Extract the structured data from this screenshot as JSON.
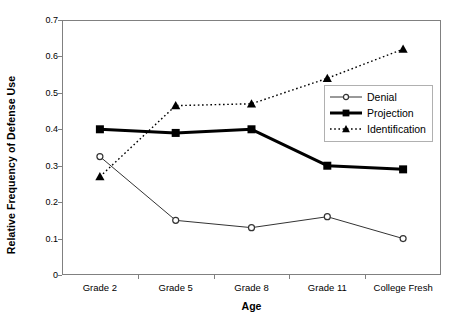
{
  "chart_data": {
    "type": "line",
    "title": "",
    "xlabel": "Age",
    "ylabel": "Relative Frequency of Defense Use",
    "categories": [
      "Grade 2",
      "Grade 5",
      "Grade 8",
      "Grade 11",
      "College Fresh"
    ],
    "ylim": [
      0,
      0.7
    ],
    "yticks": [
      "0",
      "0.1",
      "0.2",
      "0.3",
      "0.4",
      "0.5",
      "0.6",
      "0.7"
    ],
    "ytick_values": [
      0,
      0.1,
      0.2,
      0.3,
      0.4,
      0.5,
      0.6,
      0.7
    ],
    "grid": false,
    "legend_position": "inside-right",
    "series": [
      {
        "name": "Denial",
        "marker": "circle",
        "line_style": "solid",
        "line_width": 1,
        "color": "#333333",
        "values": [
          0.325,
          0.15,
          0.13,
          0.16,
          0.1
        ]
      },
      {
        "name": "Projection",
        "marker": "square",
        "line_style": "solid",
        "line_width": 3,
        "color": "#000000",
        "values": [
          0.4,
          0.39,
          0.4,
          0.3,
          0.29
        ]
      },
      {
        "name": "Identification",
        "marker": "triangle",
        "line_style": "dotted",
        "line_width": 1.4,
        "color": "#000000",
        "values": [
          0.27,
          0.465,
          0.47,
          0.54,
          0.62
        ]
      }
    ]
  },
  "legend": {
    "items": [
      {
        "label": "Denial"
      },
      {
        "label": "Projection"
      },
      {
        "label": "Identification"
      }
    ]
  },
  "axes": {
    "x_title": "Age",
    "y_title": "Relative Frequency of Defense Use"
  }
}
